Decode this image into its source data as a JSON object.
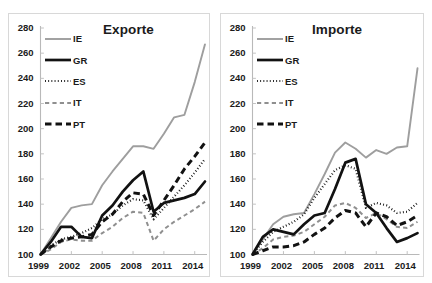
{
  "figure": {
    "panels": [
      {
        "id": "exporte",
        "title": "Exporte",
        "legend": [
          {
            "label": "IE",
            "style": "solid-thin-gray",
            "color": "#9a9a9a"
          },
          {
            "label": "GR",
            "style": "solid-thick-black",
            "color": "#111111"
          },
          {
            "label": "ES",
            "style": "dotted-black",
            "color": "#111111"
          },
          {
            "label": "IT",
            "style": "dashed-gray",
            "color": "#8c8c8c"
          },
          {
            "label": "PT",
            "style": "dashed-thick-black",
            "color": "#111111"
          }
        ]
      },
      {
        "id": "importe",
        "title": "Importe",
        "legend": [
          {
            "label": "IE",
            "style": "solid-thin-gray",
            "color": "#9a9a9a"
          },
          {
            "label": "GR",
            "style": "solid-thick-black",
            "color": "#111111"
          },
          {
            "label": "ES",
            "style": "dotted-black",
            "color": "#111111"
          },
          {
            "label": "IT",
            "style": "dashed-gray",
            "color": "#8c8c8c"
          },
          {
            "label": "PT",
            "style": "dashed-thick-black",
            "color": "#111111"
          }
        ]
      }
    ],
    "axis": {
      "yticks": [
        280,
        260,
        240,
        220,
        200,
        180,
        160,
        140,
        120,
        100
      ],
      "xticks": [
        "1999",
        "2002",
        "2005",
        "2008",
        "2011",
        "2014"
      ],
      "ylim": [
        100,
        280
      ],
      "xlim": [
        1999,
        2015
      ]
    }
  },
  "chart_data": [
    {
      "type": "line",
      "title": "Exporte",
      "xlabel": "",
      "ylabel": "",
      "ylim": [
        100,
        280
      ],
      "yticks": [
        100,
        120,
        140,
        160,
        180,
        200,
        220,
        240,
        260,
        280
      ],
      "xticks": [
        1999,
        2002,
        2005,
        2008,
        2011,
        2014
      ],
      "grid": false,
      "legend_position": "upper-left",
      "x": [
        1999,
        2000,
        2001,
        2002,
        2003,
        2004,
        2005,
        2006,
        2007,
        2008,
        2009,
        2010,
        2011,
        2012,
        2013,
        2014,
        2015
      ],
      "series": [
        {
          "name": "IE",
          "style": "solid-thin-gray",
          "values": [
            100,
            113,
            126,
            137,
            139,
            140,
            155,
            166,
            176,
            186,
            186,
            184,
            196,
            209,
            211,
            237,
            267
          ]
        },
        {
          "name": "GR",
          "style": "solid-thick-black",
          "values": [
            100,
            110,
            122,
            122,
            114,
            113,
            131,
            139,
            150,
            159,
            166,
            134,
            141,
            143,
            145,
            148,
            158
          ]
        },
        {
          "name": "ES",
          "style": "dotted-black",
          "values": [
            100,
            107,
            112,
            114,
            117,
            121,
            128,
            132,
            139,
            144,
            143,
            128,
            137,
            146,
            155,
            165,
            176
          ]
        },
        {
          "name": "IT",
          "style": "dashed-gray",
          "values": [
            100,
            104,
            110,
            112,
            111,
            111,
            117,
            122,
            129,
            134,
            133,
            111,
            120,
            126,
            131,
            136,
            142
          ]
        },
        {
          "name": "PT",
          "style": "dashed-thick-black",
          "values": [
            100,
            106,
            111,
            113,
            114,
            116,
            126,
            132,
            142,
            149,
            148,
            131,
            143,
            155,
            168,
            178,
            189
          ]
        }
      ]
    },
    {
      "type": "line",
      "title": "Importe",
      "xlabel": "",
      "ylabel": "",
      "ylim": [
        100,
        280
      ],
      "yticks": [
        100,
        120,
        140,
        160,
        180,
        200,
        220,
        240,
        260,
        280
      ],
      "xticks": [
        1999,
        2002,
        2005,
        2008,
        2011,
        2014
      ],
      "grid": false,
      "legend_position": "upper-left",
      "x": [
        1999,
        2000,
        2001,
        2002,
        2003,
        2004,
        2005,
        2006,
        2007,
        2008,
        2009,
        2010,
        2011,
        2012,
        2013,
        2014,
        2015
      ],
      "series": [
        {
          "name": "IE",
          "style": "solid-thin-gray",
          "values": [
            100,
            112,
            124,
            130,
            132,
            133,
            148,
            164,
            181,
            189,
            184,
            177,
            183,
            180,
            185,
            186,
            248
          ]
        },
        {
          "name": "GR",
          "style": "solid-thick-black",
          "values": [
            100,
            114,
            120,
            118,
            116,
            124,
            131,
            133,
            152,
            173,
            176,
            140,
            133,
            121,
            110,
            113,
            117
          ]
        },
        {
          "name": "ES",
          "style": "dotted-black",
          "values": [
            100,
            110,
            118,
            122,
            126,
            132,
            145,
            156,
            167,
            171,
            168,
            137,
            141,
            139,
            133,
            134,
            141
          ]
        },
        {
          "name": "IT",
          "style": "dashed-gray",
          "values": [
            100,
            105,
            112,
            114,
            115,
            118,
            124,
            130,
            139,
            141,
            137,
            129,
            133,
            128,
            122,
            121,
            126
          ]
        },
        {
          "name": "PT",
          "style": "dashed-thick-black",
          "values": [
            100,
            103,
            106,
            106,
            107,
            110,
            116,
            121,
            129,
            135,
            133,
            122,
            133,
            130,
            123,
            126,
            131
          ]
        }
      ]
    }
  ]
}
